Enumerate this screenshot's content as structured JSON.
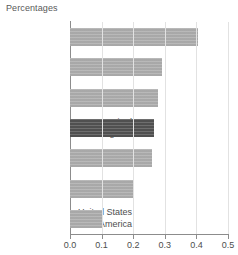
{
  "chart_data": {
    "type": "bar",
    "orientation": "horizontal",
    "title": "Percentages",
    "xlabel": "",
    "ylabel": "",
    "xlim": [
      0.0,
      0.5
    ],
    "grid": true,
    "legend": null,
    "categories": [
      "France",
      "Canada",
      "Japan",
      "United\nKingdom",
      "Germany",
      "Italy",
      "United States\nof America"
    ],
    "values": [
      0.405,
      0.29,
      0.28,
      0.265,
      0.26,
      0.2,
      0.1
    ],
    "tick_labels": [
      "0.0",
      "0.1",
      "0.2",
      "0.3",
      "0.4",
      "0.5"
    ],
    "tick_values": [
      0.0,
      0.1,
      0.2,
      0.3,
      0.4,
      0.5
    ],
    "highlighted_category": "United\nKingdom",
    "colors": {
      "bar": "#ababab",
      "bar_highlight": "#595959",
      "axis": "#8c8c8c",
      "grid": "#e2e2e2",
      "text": "#4d4d4d",
      "title_text": "#595959",
      "background": "#ffffff"
    }
  }
}
